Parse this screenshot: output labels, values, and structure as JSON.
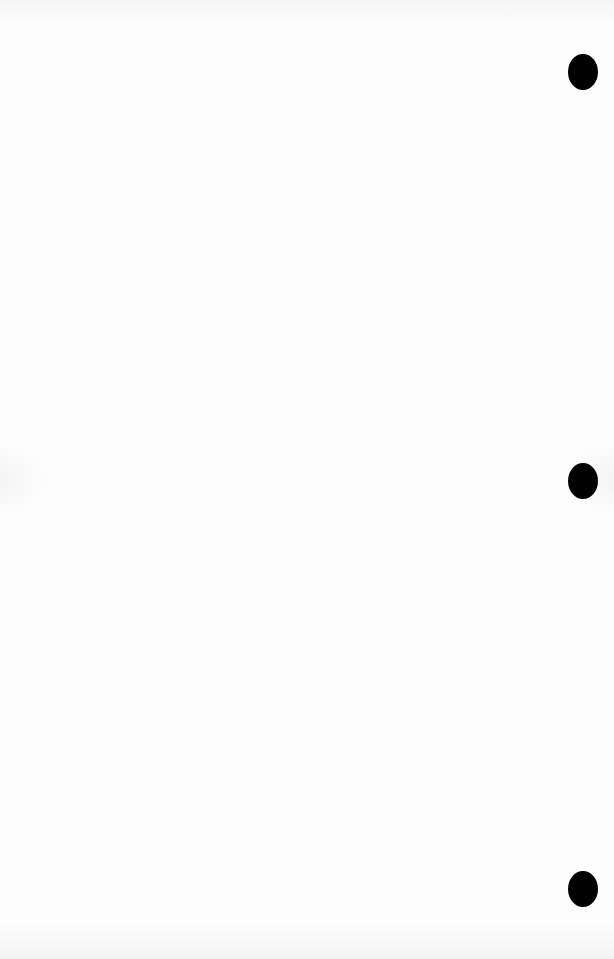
{
  "page": {
    "background_color": "#fdfdfd",
    "content": "",
    "punch_holes": [
      {
        "cx": 583,
        "cy": 72
      },
      {
        "cx": 583,
        "cy": 481
      },
      {
        "cx": 583,
        "cy": 889
      }
    ],
    "hole_color": "#000000"
  }
}
